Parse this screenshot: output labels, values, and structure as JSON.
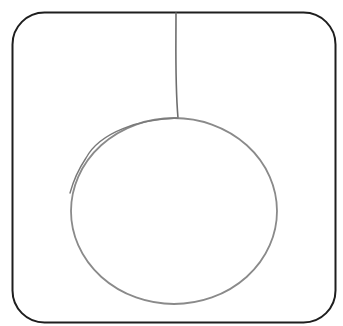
{
  "drawing": {
    "subject": "hanging-ornament-sketch",
    "frame": {
      "x": 12.5,
      "y": 12.5,
      "width": 323,
      "height": 310,
      "radius": 32,
      "stroke": "#1e1e1e",
      "stroke_width": 2
    },
    "string": {
      "x_top": 176,
      "y_top": 13,
      "x_bottom": 178,
      "y_bottom": 118,
      "stroke": "#6e6e6e",
      "stroke_width": 1.6
    },
    "ball": {
      "cx": 174,
      "cy": 211,
      "rx": 103,
      "ry": 93,
      "stroke": "#8a8a8a",
      "stroke_width": 1.8
    },
    "overdraw_stroke": {
      "stroke": "#7a7a7a",
      "stroke_width": 1.4
    }
  }
}
